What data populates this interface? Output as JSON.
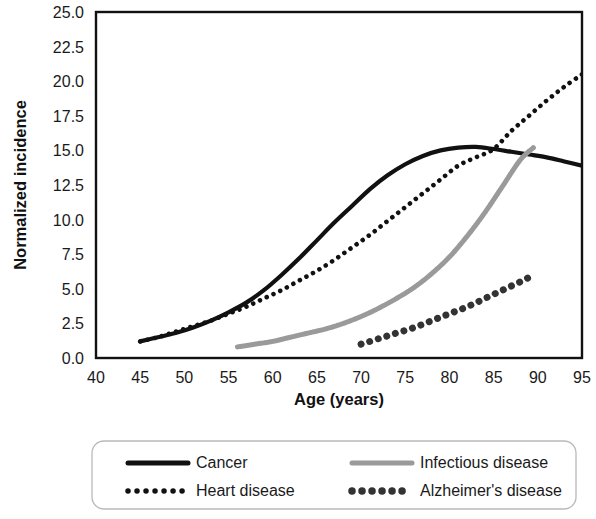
{
  "chart_data": {
    "type": "line",
    "title": "",
    "xlabel": "Age (years)",
    "ylabel": "Normalized incidence",
    "xlim": [
      40,
      95
    ],
    "ylim": [
      0.0,
      25.0
    ],
    "xticks": [
      40,
      45,
      50,
      55,
      60,
      65,
      70,
      75,
      80,
      85,
      90,
      95
    ],
    "xtick_labels": [
      "40",
      "45",
      "50",
      "55",
      "60",
      "65",
      "70",
      "75",
      "80",
      "85",
      "90",
      "95"
    ],
    "yticks": [
      0.0,
      2.5,
      5.0,
      7.5,
      10.0,
      12.5,
      15.0,
      17.5,
      20.0,
      22.5,
      25.0
    ],
    "ytick_labels": [
      "0.0",
      "2.5",
      "5.0",
      "7.5",
      "10.0",
      "12.5",
      "15.0",
      "17.5",
      "20.0",
      "22.5",
      "25.0"
    ],
    "grid": true,
    "legend_position": "below",
    "series": [
      {
        "name": "Cancer",
        "style": "solid",
        "color": "#111111",
        "width": 4.2,
        "x": [
          45,
          47,
          49,
          51,
          53,
          55,
          57,
          59,
          61,
          63,
          65,
          67,
          69,
          71,
          73,
          75,
          77,
          79,
          81,
          83,
          85,
          87,
          89,
          91,
          93,
          95
        ],
        "y": [
          1.2,
          1.5,
          1.8,
          2.2,
          2.7,
          3.3,
          4.0,
          4.9,
          6.0,
          7.2,
          8.5,
          9.8,
          11.0,
          12.2,
          13.2,
          14.0,
          14.6,
          15.0,
          15.2,
          15.25,
          15.1,
          14.9,
          14.7,
          14.5,
          14.2,
          13.9
        ]
      },
      {
        "name": "Heart disease",
        "style": "dotted",
        "color": "#111111",
        "width": 4.6,
        "x": [
          45,
          47,
          49,
          51,
          53,
          55,
          57,
          59,
          61,
          63,
          65,
          67,
          69,
          71,
          73,
          75,
          77,
          79,
          81,
          83,
          85,
          87,
          89,
          91,
          93,
          95
        ],
        "y": [
          1.2,
          1.5,
          1.9,
          2.3,
          2.7,
          3.2,
          3.7,
          4.3,
          4.9,
          5.6,
          6.3,
          7.1,
          8.0,
          8.9,
          9.9,
          10.9,
          11.9,
          12.9,
          13.9,
          14.5,
          15.1,
          16.4,
          17.5,
          18.6,
          19.6,
          20.5
        ]
      },
      {
        "name": "Infectious disease",
        "style": "hatched",
        "color": "#9a9a9a",
        "width": 5.0,
        "x": [
          56,
          58,
          60,
          62,
          64,
          66,
          68,
          70,
          72,
          74,
          76,
          78,
          80,
          82,
          84,
          86,
          88,
          89.5
        ],
        "y": [
          0.8,
          1.0,
          1.2,
          1.5,
          1.8,
          2.1,
          2.5,
          3.0,
          3.6,
          4.3,
          5.1,
          6.1,
          7.3,
          8.8,
          10.5,
          12.4,
          14.3,
          15.2
        ]
      },
      {
        "name": "Alzheimer's disease",
        "style": "dotted-large",
        "color": "#333333",
        "width": 7.0,
        "x": [
          70,
          72,
          74,
          76,
          78,
          80,
          82,
          84,
          86,
          88,
          89.5
        ],
        "y": [
          1.0,
          1.4,
          1.8,
          2.2,
          2.7,
          3.2,
          3.7,
          4.3,
          4.9,
          5.5,
          6.0
        ]
      }
    ]
  },
  "legend": {
    "items": [
      {
        "label": "Cancer",
        "swatch": "solid-line-swatch",
        "color": "#111111"
      },
      {
        "label": "Infectious disease",
        "swatch": "hatched-line-swatch",
        "color": "#9a9a9a"
      },
      {
        "label": "Heart disease",
        "swatch": "small-dots-swatch",
        "color": "#111111"
      },
      {
        "label": "Alzheimer's disease",
        "swatch": "large-dots-swatch",
        "color": "#333333"
      }
    ]
  }
}
